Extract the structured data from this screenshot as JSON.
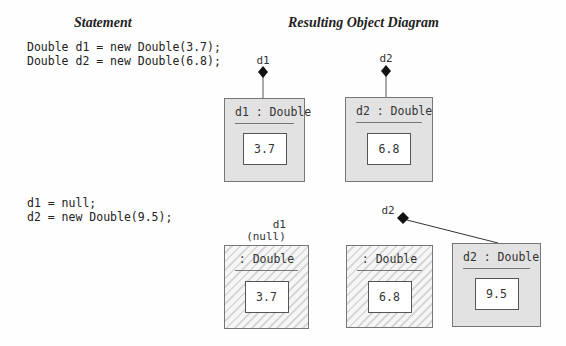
{
  "headers": {
    "statement": "Statement",
    "diagram": "Resulting Object Diagram"
  },
  "statements": [
    {
      "lines": [
        "Double d1 = new Double(3.7);",
        "Double d2 = new Double(6.8);"
      ]
    },
    {
      "lines": [
        "d1 = null;",
        "d2 = new Double(9.5);"
      ]
    }
  ],
  "diagram1": {
    "refs": [
      {
        "name": "d1"
      },
      {
        "name": "d2"
      }
    ],
    "objects": [
      {
        "title": "d1 : Double",
        "value": "3.7",
        "garbage": false
      },
      {
        "title": "d2 : Double",
        "value": "6.8",
        "garbage": false
      }
    ]
  },
  "diagram2": {
    "refs": [
      {
        "name": "d1",
        "note": "(null)"
      },
      {
        "name": "d2"
      }
    ],
    "objects": [
      {
        "title": ": Double",
        "value": "3.7",
        "garbage": true
      },
      {
        "title": ": Double",
        "value": "6.8",
        "garbage": true
      },
      {
        "title": "d2 : Double",
        "value": "9.5",
        "garbage": false
      }
    ]
  },
  "colors": {
    "object_fill": "#e2e2e2",
    "border": "#777777",
    "text": "#222222"
  }
}
